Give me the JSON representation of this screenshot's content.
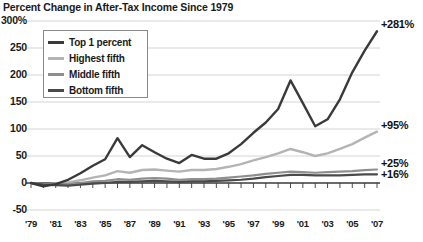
{
  "chart_data": {
    "type": "line",
    "title": "Percent Change in After-Tax Income Since 1979",
    "xlabel": "",
    "ylabel": "",
    "ylim": [
      -50,
      300
    ],
    "xlim": [
      1979,
      2007
    ],
    "grid": true,
    "legend_position": "top-left",
    "ytick_labels": [
      "300%",
      "250",
      "200",
      "150",
      "100",
      "50",
      "0",
      "-50"
    ],
    "ytick_values": [
      300,
      250,
      200,
      150,
      100,
      50,
      0,
      -50
    ],
    "xtick_labels": [
      "'79",
      "'81",
      "'83",
      "'85",
      "'87",
      "'89",
      "'91",
      "'93",
      "'95",
      "'97",
      "'99",
      "'01",
      "'03",
      "'05",
      "'07"
    ],
    "xtick_values": [
      1979,
      1981,
      1983,
      1985,
      1987,
      1989,
      1991,
      1993,
      1995,
      1997,
      1999,
      2001,
      2003,
      2005,
      2007
    ],
    "x": [
      1979,
      1980,
      1981,
      1982,
      1983,
      1984,
      1985,
      1986,
      1987,
      1988,
      1989,
      1990,
      1991,
      1992,
      1993,
      1994,
      1995,
      1996,
      1997,
      1998,
      1999,
      2000,
      2001,
      2002,
      2003,
      2004,
      2005,
      2006,
      2007
    ],
    "series": [
      {
        "name": "Top 1 percent",
        "color": "#3a3a3a",
        "width": 2.4,
        "end_label": "+281%",
        "end_value": 281,
        "values": [
          0,
          -6,
          -2,
          6,
          18,
          32,
          44,
          83,
          48,
          70,
          57,
          45,
          37,
          52,
          45,
          45,
          55,
          72,
          93,
          112,
          137,
          190,
          148,
          105,
          118,
          155,
          205,
          245,
          281
        ]
      },
      {
        "name": "Highest fifth",
        "color": "#b4b4b4",
        "width": 2.4,
        "end_label": "+95%",
        "end_value": 95,
        "values": [
          0,
          -3,
          -1,
          1,
          5,
          10,
          14,
          22,
          19,
          24,
          25,
          23,
          21,
          24,
          24,
          26,
          30,
          35,
          42,
          48,
          55,
          63,
          57,
          50,
          55,
          63,
          72,
          84,
          95
        ]
      },
      {
        "name": "Middle fifth",
        "color": "#8e8e8e",
        "width": 2.2,
        "end_label": "+25%",
        "end_value": 25,
        "values": [
          0,
          -2,
          -2,
          -2,
          0,
          3,
          4,
          7,
          6,
          8,
          9,
          8,
          6,
          7,
          7,
          8,
          10,
          12,
          14,
          17,
          19,
          21,
          20,
          19,
          20,
          21,
          22,
          24,
          25
        ]
      },
      {
        "name": "Bottom fifth",
        "color": "#4a4a4a",
        "width": 2.2,
        "end_label": "+16%",
        "end_value": 16,
        "values": [
          0,
          -3,
          -4,
          -5,
          -3,
          -1,
          0,
          2,
          2,
          3,
          4,
          3,
          2,
          3,
          3,
          4,
          5,
          6,
          8,
          11,
          13,
          15,
          15,
          14,
          14,
          14,
          15,
          16,
          16
        ]
      }
    ]
  },
  "legend": {
    "items": [
      {
        "label": "Top 1 percent",
        "color": "#3a3a3a"
      },
      {
        "label": "Highest fifth",
        "color": "#b4b4b4"
      },
      {
        "label": "Middle fifth",
        "color": "#8e8e8e"
      },
      {
        "label": "Bottom fifth",
        "color": "#4a4a4a"
      }
    ]
  },
  "colors": {
    "grid": "#c9c9c9",
    "axis": "#3a3a3a",
    "text": "#1a1a1a",
    "background": "#ffffff"
  }
}
